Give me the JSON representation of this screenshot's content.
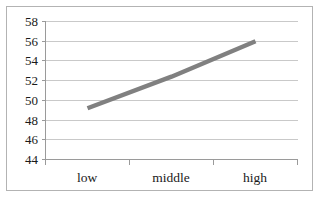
{
  "chart_data": {
    "type": "line",
    "title": "",
    "xlabel": "",
    "ylabel": "",
    "categories": [
      "low",
      "middle",
      "high"
    ],
    "series": [
      {
        "name": "series-1",
        "values": [
          49.2,
          52.4,
          56.0
        ],
        "color": "#808080"
      }
    ],
    "ylim": [
      44,
      58
    ],
    "yticks": [
      58,
      56,
      54,
      52,
      50,
      48,
      46,
      44
    ],
    "ytick_labels": [
      "58",
      "56",
      "54",
      "52",
      "50",
      "48",
      "46",
      "44"
    ],
    "grid": true,
    "grid_axis": "y",
    "legend": "none",
    "legend_position": "none"
  },
  "style": {
    "line_color": "#808080",
    "grid_color": "#c9c9c9",
    "axis_color": "#9a9a9a",
    "border_color": "#b3b3b3",
    "text_color": "#1a1a1a",
    "background": "#ffffff",
    "line_width": "4.5"
  }
}
